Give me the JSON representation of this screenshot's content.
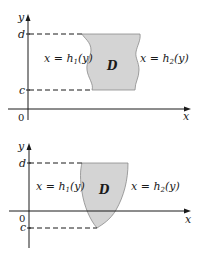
{
  "figures": [
    {
      "id": "type-II-region-top",
      "axis_labels": {
        "y": "y",
        "x": "x",
        "origin": "0"
      },
      "bounds": {
        "upper": "d",
        "lower": "c"
      },
      "left_curve_label": {
        "lhs": "x = h",
        "sub": "1",
        "rhs": "(y)"
      },
      "right_curve_label": {
        "lhs": "x = h",
        "sub": "2",
        "rhs": "(y)"
      },
      "region_label": "D"
    },
    {
      "id": "type-II-region-bottom",
      "axis_labels": {
        "y": "y",
        "x": "x",
        "origin": "0"
      },
      "bounds": {
        "upper": "d",
        "lower": "c"
      },
      "left_curve_label": {
        "lhs": "x = h",
        "sub": "1",
        "rhs": "(y)"
      },
      "right_curve_label": {
        "lhs": "x = h",
        "sub": "2",
        "rhs": "(y)"
      },
      "region_label": "D"
    }
  ],
  "colors": {
    "region_fill": "#d4d4d4",
    "region_stroke": "#8a8a8a",
    "ink": "#1a1a1a"
  }
}
